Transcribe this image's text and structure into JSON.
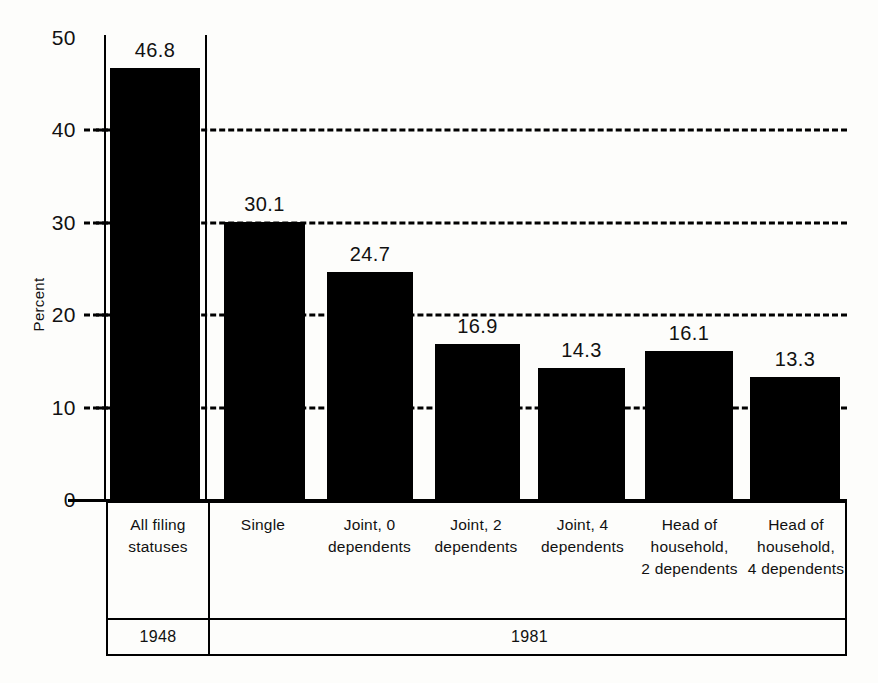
{
  "chart_data": {
    "type": "bar",
    "title": "",
    "xlabel": "",
    "ylabel": "Percent",
    "ylim": [
      0,
      50
    ],
    "yticks": [
      0,
      10,
      20,
      30,
      40,
      50
    ],
    "ytick_labels": [
      "0",
      "10",
      "20",
      "30",
      "40",
      "50"
    ],
    "grid": "horizontal-dashed",
    "legend": "none",
    "categories": [
      "All filing statuses",
      "Single",
      "Joint, 0 dependents",
      "Joint, 2 dependents",
      "Joint, 4 dependents",
      "Head of household, 2 dependents",
      "Head of household, 4 dependents"
    ],
    "values": [
      46.8,
      30.1,
      24.7,
      16.9,
      14.3,
      16.1,
      13.3
    ],
    "bar_color": "#000000",
    "groups": [
      {
        "label": "1948",
        "categories": [
          "All filing statuses"
        ]
      },
      {
        "label": "1981",
        "categories": [
          "Single",
          "Joint, 0 dependents",
          "Joint, 2 dependents",
          "Joint, 4 dependents",
          "Head of household, 2 dependents",
          "Head of household, 4 dependents"
        ]
      }
    ]
  },
  "axis": {
    "y_title": "Percent",
    "ticks": [
      {
        "value": 50,
        "label": "50"
      },
      {
        "value": 40,
        "label": "40"
      },
      {
        "value": 30,
        "label": "30"
      },
      {
        "value": 20,
        "label": "20"
      },
      {
        "value": 10,
        "label": "10"
      },
      {
        "value": 0,
        "label": "0"
      }
    ]
  },
  "bars": [
    {
      "label": "All filing statuses",
      "value": 46.8,
      "value_label": "46.8"
    },
    {
      "label": "Single",
      "value": 30.1,
      "value_label": "30.1"
    },
    {
      "label": "Joint, 0 dependents",
      "value": 24.7,
      "value_label": "24.7"
    },
    {
      "label": "Joint, 2 dependents",
      "value": 16.9,
      "value_label": "16.9"
    },
    {
      "label": "Joint, 4 dependents",
      "value": 14.3,
      "value_label": "14.3"
    },
    {
      "label": "Head of household, 2 dependents",
      "value": 16.1,
      "value_label": "16.1"
    },
    {
      "label": "Head of household, 4 dependents",
      "value": 13.3,
      "value_label": "13.3"
    }
  ],
  "label_table": {
    "categories": [
      {
        "line1": "All filing",
        "line2": "statuses",
        "line3": ""
      },
      {
        "line1": "Single",
        "line2": "",
        "line3": ""
      },
      {
        "line1": "Joint, 0",
        "line2": "dependents",
        "line3": ""
      },
      {
        "line1": "Joint, 2",
        "line2": "dependents",
        "line3": ""
      },
      {
        "line1": "Joint, 4",
        "line2": "dependents",
        "line3": ""
      },
      {
        "line1": "Head of",
        "line2": "household,",
        "line3": "2 dependents"
      },
      {
        "line1": "Head of",
        "line2": "household,",
        "line3": "4 dependents"
      }
    ],
    "years": [
      {
        "label": "1948"
      },
      {
        "label": "1981"
      }
    ]
  }
}
